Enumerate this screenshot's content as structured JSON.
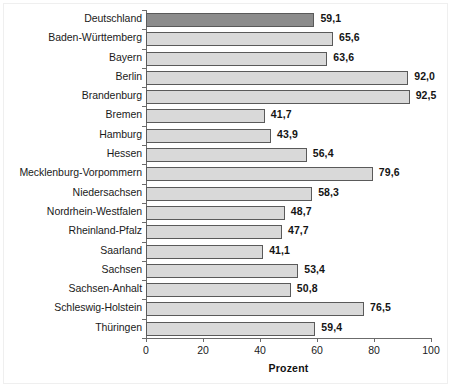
{
  "chart_data": {
    "type": "bar",
    "orientation": "horizontal",
    "title": "",
    "subtitle": "",
    "xlabel": "Prozent",
    "ylabel": "",
    "xlim": [
      0,
      100
    ],
    "xticks": [
      0,
      20,
      40,
      60,
      80,
      100
    ],
    "xtick_labels": [
      "0",
      "20",
      "40",
      "60",
      "80",
      "100"
    ],
    "grid": false,
    "legend": null,
    "decimal_separator": ",",
    "highlight_category": "Deutschland",
    "colors": {
      "bar_fill": "#d9d9d9",
      "bar_highlight_fill": "#8c8c8c",
      "bar_border": "#5a5a5a",
      "axis": "#6b6b6b",
      "text": "#1a1a1a",
      "background": "#ffffff",
      "frame": "#efefef"
    },
    "categories": [
      "Deutschland",
      "Baden-Württemberg",
      "Bayern",
      "Berlin",
      "Brandenburg",
      "Bremen",
      "Hamburg",
      "Hessen",
      "Mecklenburg-Vorpommern",
      "Niedersachsen",
      "Nordrhein-Westfalen",
      "Rheinland-Pfalz",
      "Saarland",
      "Sachsen",
      "Sachsen-Anhalt",
      "Schleswig-Holstein",
      "Thüringen"
    ],
    "values": [
      59.1,
      65.6,
      63.6,
      92.0,
      92.5,
      41.7,
      43.9,
      56.4,
      79.6,
      58.3,
      48.7,
      47.7,
      41.1,
      53.4,
      50.8,
      76.5,
      59.4
    ],
    "value_labels": [
      "59,1",
      "65,6",
      "63,6",
      "92,0",
      "92,5",
      "41,7",
      "43,9",
      "56,4",
      "79,6",
      "58,3",
      "48,7",
      "47,7",
      "41,1",
      "53,4",
      "50,8",
      "76,5",
      "59,4"
    ],
    "bars": [
      {
        "category": "Deutschland",
        "value": 59.1,
        "label": "59,1",
        "highlight": true
      },
      {
        "category": "Baden-Württemberg",
        "value": 65.6,
        "label": "65,6",
        "highlight": false
      },
      {
        "category": "Bayern",
        "value": 63.6,
        "label": "63,6",
        "highlight": false
      },
      {
        "category": "Berlin",
        "value": 92.0,
        "label": "92,0",
        "highlight": false
      },
      {
        "category": "Brandenburg",
        "value": 92.5,
        "label": "92,5",
        "highlight": false
      },
      {
        "category": "Bremen",
        "value": 41.7,
        "label": "41,7",
        "highlight": false
      },
      {
        "category": "Hamburg",
        "value": 43.9,
        "label": "43,9",
        "highlight": false
      },
      {
        "category": "Hessen",
        "value": 56.4,
        "label": "56,4",
        "highlight": false
      },
      {
        "category": "Mecklenburg-Vorpommern",
        "value": 79.6,
        "label": "79,6",
        "highlight": false
      },
      {
        "category": "Niedersachsen",
        "value": 58.3,
        "label": "58,3",
        "highlight": false
      },
      {
        "category": "Nordrhein-Westfalen",
        "value": 48.7,
        "label": "48,7",
        "highlight": false
      },
      {
        "category": "Rheinland-Pfalz",
        "value": 47.7,
        "label": "47,7",
        "highlight": false
      },
      {
        "category": "Saarland",
        "value": 41.1,
        "label": "41,1",
        "highlight": false
      },
      {
        "category": "Sachsen",
        "value": 53.4,
        "label": "53,4",
        "highlight": false
      },
      {
        "category": "Sachsen-Anhalt",
        "value": 50.8,
        "label": "50,8",
        "highlight": false
      },
      {
        "category": "Schleswig-Holstein",
        "value": 76.5,
        "label": "76,5",
        "highlight": false
      },
      {
        "category": "Thüringen",
        "value": 59.4,
        "label": "59,4",
        "highlight": false
      }
    ]
  }
}
